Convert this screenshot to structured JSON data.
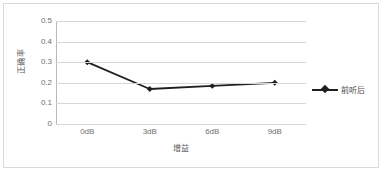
{
  "chart_data": {
    "type": "line",
    "title": "",
    "subtitle": "",
    "categories": [
      "0dB",
      "3dB",
      "6dB",
      "9dB"
    ],
    "series": [
      {
        "name": "前听后",
        "values": [
          0.3,
          0.17,
          0.185,
          0.2
        ]
      }
    ],
    "xlabel": "增益",
    "ylabel": "正确率",
    "ylim": [
      0,
      0.5
    ],
    "ytick_labels": [
      "0.5",
      "0.4",
      "0.3",
      "0.2",
      "0.1",
      "0"
    ],
    "ytick_values": [
      0.5,
      0.4,
      0.3,
      0.2,
      0.1,
      0
    ],
    "grid": true,
    "grid_axis": "y",
    "legend_position": "right",
    "marker": "diamond",
    "colors": {
      "series_line": "#1f1f1f",
      "series_marker": "#1f1f1f",
      "gridline": "#d6d6d6",
      "axis_line": "#b8b8b8",
      "tick_label": "#707070",
      "axis_title": "#5a5a5a",
      "plot_background": "#ffffff",
      "frame_border": "#d9d9d9"
    }
  },
  "legend": {
    "entries": [
      {
        "label": "前听后",
        "marker_icon": "diamond-line-marker-icon"
      }
    ]
  },
  "axes": {
    "y": {
      "title": "正确率",
      "ticks": [
        "0.5",
        "0.4",
        "0.3",
        "0.2",
        "0.1",
        "0"
      ]
    },
    "x": {
      "title": "增益",
      "ticks": [
        "0dB",
        "3dB",
        "6dB",
        "9dB"
      ]
    }
  }
}
